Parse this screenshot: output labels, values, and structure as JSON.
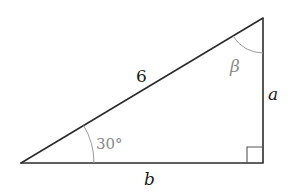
{
  "diagram": {
    "type": "right-triangle",
    "vertices": {
      "left": {
        "x": 21,
        "y": 163
      },
      "right_angle": {
        "x": 263,
        "y": 163
      },
      "top": {
        "x": 263,
        "y": 18
      }
    },
    "sides": {
      "hypotenuse": {
        "label": "6"
      },
      "vertical": {
        "label": "a"
      },
      "base": {
        "label": "b"
      }
    },
    "angles": {
      "left": {
        "label": "30°"
      },
      "top": {
        "label": "β"
      },
      "right": {
        "marker": "square"
      }
    },
    "colors": {
      "line": "#2b2b2b",
      "arc": "#9a9a9a",
      "angle_label": "#8a8a8a",
      "side_label": "#1a1a1a"
    }
  }
}
